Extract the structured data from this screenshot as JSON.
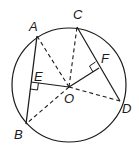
{
  "diagram": {
    "type": "circle-geometry",
    "labels": {
      "A": "A",
      "B": "B",
      "C": "C",
      "D": "D",
      "E": "E",
      "F": "F",
      "O": "O"
    },
    "points": {
      "O": [
        69,
        87
      ],
      "A": [
        37,
        36
      ],
      "B": [
        26,
        124
      ],
      "C": [
        77,
        27
      ],
      "D": [
        120,
        101
      ],
      "E": [
        31,
        82
      ],
      "F": [
        99,
        68
      ]
    },
    "circle": {
      "cx": 69,
      "cy": 85,
      "r": 57
    },
    "solid_segments": [
      [
        "A",
        "B"
      ],
      [
        "C",
        "D"
      ],
      [
        "O",
        "E"
      ],
      [
        "O",
        "F"
      ]
    ],
    "dashed_segments": [
      [
        "O",
        "A"
      ],
      [
        "O",
        "B"
      ],
      [
        "O",
        "C"
      ],
      [
        "O",
        "D"
      ]
    ],
    "right_angles": [
      "E",
      "F"
    ],
    "stroke_color": "#1a1a1a"
  }
}
